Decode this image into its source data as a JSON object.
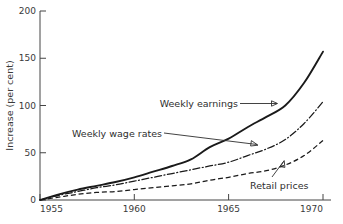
{
  "chart_data": {
    "type": "line",
    "title": "",
    "subtitle": "",
    "xlabel": "",
    "ylabel": "Increase (per cent)",
    "xlim": [
      1955,
      1970
    ],
    "ylim": [
      0,
      200
    ],
    "xticks": [
      "1955",
      "1960",
      "1965",
      "1970"
    ],
    "xtick_values": [
      1955,
      1960,
      1965,
      1970
    ],
    "yticks": [
      "0",
      "50",
      "100",
      "150",
      "200"
    ],
    "ytick_values": [
      0,
      50,
      100,
      150,
      200
    ],
    "grid": false,
    "legend_position": "inline-annotations",
    "x": [
      1955,
      1956,
      1957,
      1958,
      1959,
      1960,
      1961,
      1962,
      1963,
      1964,
      1965,
      1966,
      1967,
      1968,
      1969,
      1970
    ],
    "series": [
      {
        "name": "Weekly earnings",
        "style": "solid",
        "color": "#1a1a1a",
        "values": [
          0,
          6,
          11,
          15,
          19,
          24,
          30,
          36,
          43,
          56,
          65,
          77,
          88,
          100,
          124,
          157
        ]
      },
      {
        "name": "Weekly wage rates",
        "style": "dash-dot",
        "color": "#1a1a1a",
        "values": [
          0,
          5,
          9,
          13,
          16,
          20,
          24,
          28,
          32,
          36,
          40,
          47,
          54,
          64,
          81,
          104
        ]
      },
      {
        "name": "Retail prices",
        "style": "dashed",
        "color": "#1a1a1a",
        "values": [
          0,
          3,
          6,
          8,
          9,
          11,
          13,
          15,
          17,
          21,
          24,
          28,
          31,
          37,
          47,
          63
        ]
      }
    ],
    "annotations": [
      {
        "text": "Weekly earnings",
        "target_series": "Weekly earnings",
        "arrow": "right"
      },
      {
        "text": "Weekly wage rates",
        "target_series": "Weekly wage rates",
        "arrow": "right"
      },
      {
        "text": "Retail prices",
        "target_series": "Retail prices",
        "arrow": "up-right"
      }
    ]
  }
}
